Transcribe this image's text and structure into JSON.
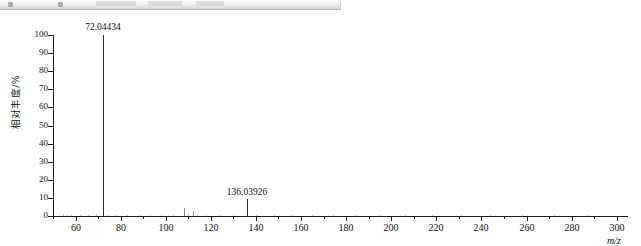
{
  "window": {
    "toolbar_visible": true,
    "toolbar_label": ""
  },
  "chart_data": {
    "type": "bar",
    "title": "",
    "subtitle": "",
    "xlabel": "m/z",
    "ylabel": "相对丰度/%",
    "xlim": [
      50,
      305
    ],
    "ylim": [
      0,
      100
    ],
    "grid": false,
    "legend": null,
    "x_major_ticks": [
      60,
      80,
      100,
      120,
      140,
      160,
      180,
      200,
      220,
      240,
      260,
      280,
      300
    ],
    "x_major_tick_labels": [
      "60",
      "80",
      "100",
      "120",
      "140",
      "160",
      "180",
      "200",
      "220",
      "240",
      "260",
      "280",
      "300"
    ],
    "x_minor_tick_step": 10,
    "y_ticks": [
      0,
      10,
      20,
      30,
      40,
      50,
      60,
      70,
      80,
      90,
      100
    ],
    "y_tick_labels": [
      "0",
      "10",
      "20",
      "30",
      "40",
      "50",
      "60",
      "70",
      "80",
      "90",
      "100"
    ],
    "annotations": [
      {
        "x": 72.04434,
        "y": 100,
        "text": "72.04434"
      },
      {
        "x": 136.03926,
        "y": 9,
        "text": "136.03926"
      }
    ],
    "peaks": [
      {
        "mz": 54.5,
        "intensity": 1.1
      },
      {
        "mz": 56.2,
        "intensity": 0.8
      },
      {
        "mz": 58.0,
        "intensity": 0.6
      },
      {
        "mz": 62.0,
        "intensity": 0.7
      },
      {
        "mz": 65.5,
        "intensity": 0.6
      },
      {
        "mz": 69.0,
        "intensity": 0.9
      },
      {
        "mz": 72.04434,
        "intensity": 100
      },
      {
        "mz": 74.5,
        "intensity": 0.8
      },
      {
        "mz": 78.0,
        "intensity": 0.6
      },
      {
        "mz": 83.0,
        "intensity": 0.7
      },
      {
        "mz": 88.0,
        "intensity": 0.6
      },
      {
        "mz": 93.0,
        "intensity": 0.6
      },
      {
        "mz": 98.0,
        "intensity": 0.7
      },
      {
        "mz": 103.0,
        "intensity": 0.6
      },
      {
        "mz": 108.2,
        "intensity": 4.2
      },
      {
        "mz": 110.0,
        "intensity": 0.9
      },
      {
        "mz": 112.1,
        "intensity": 2.6
      },
      {
        "mz": 114.0,
        "intensity": 1.0
      },
      {
        "mz": 118.0,
        "intensity": 0.7
      },
      {
        "mz": 124.0,
        "intensity": 0.6
      },
      {
        "mz": 130.0,
        "intensity": 0.7
      },
      {
        "mz": 136.03926,
        "intensity": 9.2
      },
      {
        "mz": 140.0,
        "intensity": 0.7
      },
      {
        "mz": 148.0,
        "intensity": 0.6
      },
      {
        "mz": 156.0,
        "intensity": 0.6
      },
      {
        "mz": 165.0,
        "intensity": 0.5
      },
      {
        "mz": 174.0,
        "intensity": 0.5
      },
      {
        "mz": 184.0,
        "intensity": 0.5
      },
      {
        "mz": 195.0,
        "intensity": 0.5
      },
      {
        "mz": 206.0,
        "intensity": 0.5
      },
      {
        "mz": 218.0,
        "intensity": 0.5
      },
      {
        "mz": 231.0,
        "intensity": 0.5
      },
      {
        "mz": 244.0,
        "intensity": 0.5
      },
      {
        "mz": 258.0,
        "intensity": 0.5
      },
      {
        "mz": 272.0,
        "intensity": 0.5
      },
      {
        "mz": 287.0,
        "intensity": 0.5
      }
    ]
  },
  "colors": {
    "peak": "#2b2b2b",
    "axis": "#1a1a1a",
    "text": "#111111",
    "background": "#ffffff"
  }
}
